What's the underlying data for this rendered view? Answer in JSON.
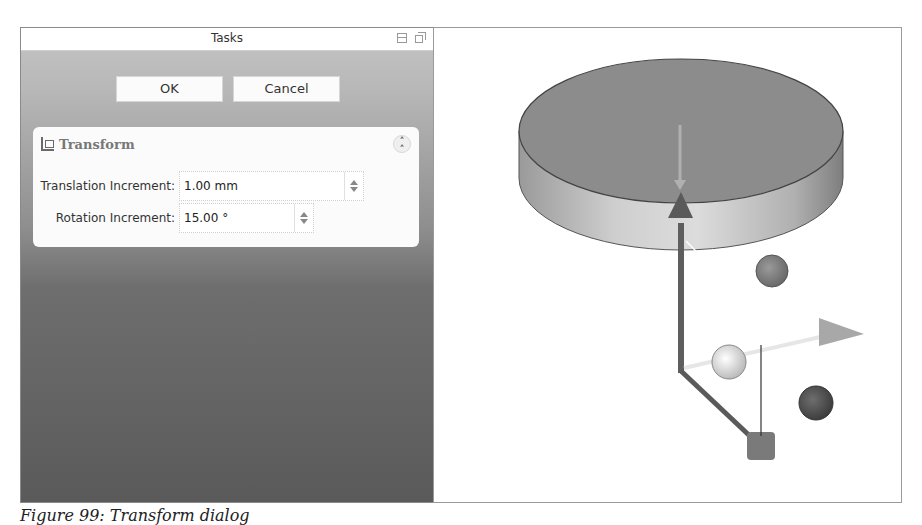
{
  "tasks_panel": {
    "title": "Tasks",
    "icons": [
      "float-icon",
      "undock-icon"
    ],
    "buttons": {
      "ok": "OK",
      "cancel": "Cancel"
    },
    "transform": {
      "title": "Transform",
      "icon": "transform-axes-icon",
      "collapse_icon": "double-chevron-up-icon",
      "translation": {
        "label": "Translation Increment:",
        "value": "1.00 mm"
      },
      "rotation": {
        "label": "Rotation Increment:",
        "value": "15.00 °"
      }
    }
  },
  "viewport": {
    "annotation": "Placement triad",
    "colors": {
      "cylinder_top": "#8a8a8a",
      "cylinder_side_light": "#d0d0d0",
      "axis": "#6a6a6a",
      "arrow": "#a8a8a8"
    }
  },
  "caption": "Figure 99: Transform dialog"
}
